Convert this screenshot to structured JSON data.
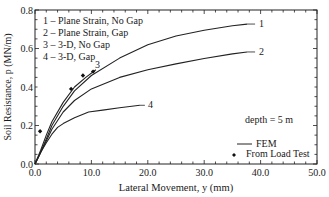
{
  "chart_data": {
    "type": "line",
    "title": "",
    "xlabel": "Lateral Movement, y  (mm)",
    "ylabel": "Soil Resistance, p  (MN/m)",
    "xlim": [
      0,
      50
    ],
    "ylim": [
      0,
      0.8
    ],
    "x_ticks": [
      "0.0",
      "10.0",
      "20.0",
      "30.0",
      "40.0",
      "50.0"
    ],
    "y_ticks": [
      "0.0",
      "0.2",
      "0.4",
      "0.6",
      "0.8"
    ],
    "grid": false,
    "annotation": "depth  =  5 m",
    "legend_position": "lower right",
    "legend": [
      {
        "marker": "line",
        "label": "FEM"
      },
      {
        "marker": "diamond",
        "label": "From Load Test"
      }
    ],
    "curve_key": [
      "1 – Plane Strain, No Gap",
      "2 – Plane Strain, Gap",
      "3 – 3-D, No Gap",
      "4 – 3-D, Gap"
    ],
    "series": [
      {
        "name": "1 - Plane Strain, No Gap",
        "label": "1",
        "kind": "FEM",
        "x": [
          0,
          1,
          2,
          3,
          5,
          7,
          10,
          15,
          20,
          25,
          30,
          35,
          37.6
        ],
        "y": [
          0,
          0.06,
          0.13,
          0.2,
          0.3,
          0.38,
          0.46,
          0.55,
          0.62,
          0.665,
          0.695,
          0.718,
          0.727
        ]
      },
      {
        "name": "2 - Plane Strain, Gap",
        "label": "2",
        "kind": "FEM",
        "x": [
          0,
          1,
          2,
          3,
          5,
          7,
          10,
          15,
          20,
          25,
          30,
          35,
          37.6
        ],
        "y": [
          0,
          0.06,
          0.12,
          0.18,
          0.27,
          0.33,
          0.39,
          0.45,
          0.49,
          0.52,
          0.548,
          0.572,
          0.582
        ]
      },
      {
        "name": "3 - 3-D, No Gap",
        "label": "3",
        "kind": "FEM",
        "x": [
          0,
          1,
          2,
          3,
          5,
          7,
          9,
          10.8
        ],
        "y": [
          0,
          0.07,
          0.15,
          0.22,
          0.32,
          0.4,
          0.45,
          0.49
        ]
      },
      {
        "name": "4 - 3-D, Gap",
        "label": "4",
        "kind": "FEM",
        "x": [
          0,
          1,
          2,
          3,
          4,
          5,
          7,
          9.5,
          12,
          15,
          18.6
        ],
        "y": [
          0,
          0.06,
          0.11,
          0.155,
          0.19,
          0.21,
          0.24,
          0.27,
          0.28,
          0.292,
          0.305
        ]
      },
      {
        "name": "From Load Test",
        "kind": "points",
        "x": [
          0.9,
          6.4,
          8.5,
          10.3
        ],
        "y": [
          0.17,
          0.39,
          0.46,
          0.48
        ]
      }
    ]
  }
}
